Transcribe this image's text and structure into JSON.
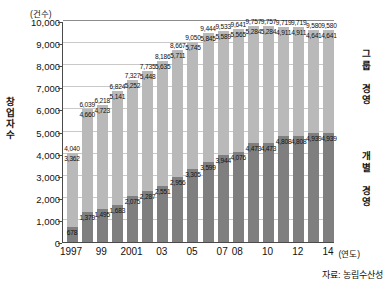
{
  "chart_data": {
    "type": "bar",
    "stacked": true,
    "title": "",
    "unit_label": "(건수)",
    "ylabel": "창업자 수",
    "xlabel": "(연도)",
    "ylim": [
      0,
      10000
    ],
    "yticks": [
      "0",
      "1,000",
      "2,000",
      "3,000",
      "4,000",
      "5,000",
      "6,000",
      "7,000",
      "8,000",
      "9,000",
      "10,000"
    ],
    "ytick_values": [
      0,
      1000,
      2000,
      3000,
      4000,
      5000,
      6000,
      7000,
      8000,
      9000,
      10000
    ],
    "grid": true,
    "legend_position": "right",
    "categories": [
      "1997",
      "1998",
      "1999",
      "2000",
      "2001",
      "2002",
      "2003",
      "2004",
      "2005",
      "2006",
      "2007",
      "2008",
      "2009",
      "2010",
      "2011",
      "2012",
      "2013",
      "2014"
    ],
    "xtick_labels": [
      "1997",
      "99",
      "2001",
      "03",
      "05",
      "07",
      "08",
      "10",
      "12",
      "14"
    ],
    "xtick_index": [
      0,
      2,
      4,
      6,
      8,
      10,
      11,
      13,
      15,
      17
    ],
    "series": [
      {
        "name": "개별 경영",
        "color": "#7f7f7f",
        "values": [
          678,
          1379,
          1495,
          1683,
          2075,
          2287,
          2551,
          2956,
          3305,
          3599,
          3944,
          4076,
          4473,
          4473,
          4808,
          4808,
          4939,
          4939
        ]
      },
      {
        "name": "그룹 경영",
        "color": "#b9b9b9",
        "values": [
          3362,
          4660,
          4723,
          5141,
          5252,
          5448,
          5635,
          5711,
          5745,
          5845,
          5589,
          5565,
          5284,
          5284,
          4911,
          4911,
          4641,
          4641
        ]
      }
    ],
    "totals": [
      4040,
      6039,
      6218,
      6824,
      7327,
      7735,
      8186,
      8667,
      9050,
      9444,
      9533,
      9641,
      9757,
      9757,
      9719,
      9719,
      9580,
      9580
    ],
    "bars": [
      {
        "x": "1997",
        "bottom": 678,
        "top": 3362,
        "total": 4040
      },
      {
        "x": "1998",
        "bottom": 1379,
        "top": 4660,
        "total": 6039
      },
      {
        "x": "1999",
        "bottom": 1495,
        "top": 4723,
        "total": 6218
      },
      {
        "x": "2000",
        "bottom": 1683,
        "top": 5141,
        "total": 6824
      },
      {
        "x": "2001",
        "bottom": 2075,
        "top": 5252,
        "total": 7327
      },
      {
        "x": "2002",
        "bottom": 2287,
        "top": 5448,
        "total": 7735
      },
      {
        "x": "2003",
        "bottom": 2551,
        "top": 5635,
        "total": 8186
      },
      {
        "x": "2004",
        "bottom": 2956,
        "top": 5711,
        "total": 8667
      },
      {
        "x": "2005",
        "bottom": 3305,
        "top": 5745,
        "total": 9050
      },
      {
        "x": "2006",
        "bottom": 3599,
        "top": 5845,
        "total": 9444
      },
      {
        "x": "2007",
        "bottom": 3944,
        "top": 5589,
        "total": 9533
      },
      {
        "x": "2008",
        "bottom": 4076,
        "top": 5565,
        "total": 9641
      },
      {
        "x": "2009",
        "bottom": 4473,
        "top": 5284,
        "total": 9757
      },
      {
        "x": "2010",
        "bottom": 4473,
        "top": 5284,
        "total": 9757
      },
      {
        "x": "2011",
        "bottom": 4808,
        "top": 4911,
        "total": 9719
      },
      {
        "x": "2012",
        "bottom": 4808,
        "top": 4911,
        "total": 9719
      },
      {
        "x": "2013",
        "bottom": 4939,
        "top": 4641,
        "total": 9580
      },
      {
        "x": "2014",
        "bottom": 4939,
        "top": 4641,
        "total": 9580
      }
    ],
    "annotations": {
      "source": "자료: 농림수산성"
    }
  },
  "legend": {
    "group_management": "그룹 경영",
    "individual_management": "개별 경영"
  },
  "colors": {
    "group": "#b9b9b9",
    "individual": "#7f7f7f",
    "axis": "#4a4a4a",
    "grid": "#c9c9c9"
  }
}
